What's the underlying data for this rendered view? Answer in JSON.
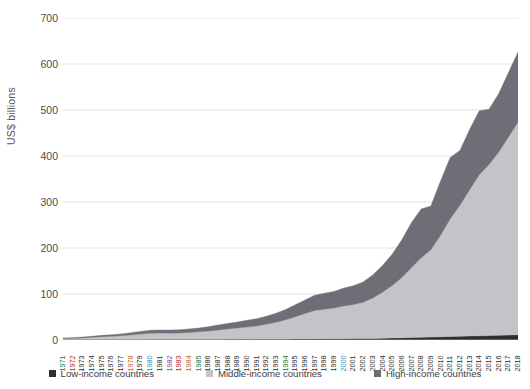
{
  "chart_data": {
    "type": "area",
    "stacked": true,
    "title": "",
    "xlabel": "",
    "ylabel": "US$ billions",
    "ylim": [
      0,
      700
    ],
    "y_ticks": [
      0,
      100,
      200,
      300,
      400,
      500,
      600,
      700
    ],
    "grid": true,
    "legend_position": "bottom",
    "x": [
      "1971",
      "1972",
      "1973",
      "1974",
      "1975",
      "1976",
      "1977",
      "1978",
      "1979",
      "1980",
      "1981",
      "1982",
      "1983",
      "1984",
      "1985",
      "1986",
      "1987",
      "1988",
      "1989",
      "1990",
      "1991",
      "1992",
      "1993",
      "1994",
      "1995",
      "1996",
      "1997",
      "1998",
      "1999",
      "2000",
      "2001",
      "2002",
      "2003",
      "2004",
      "2005",
      "2006",
      "2007",
      "2008",
      "2009",
      "2010",
      "2011",
      "2012",
      "2013",
      "2014",
      "2015",
      "2016",
      "2017",
      "2018"
    ],
    "series": [
      {
        "name": "Low-income countries",
        "color": "#2f2f33",
        "values": [
          0.2,
          0.2,
          0.3,
          0.4,
          0.5,
          0.5,
          0.6,
          0.7,
          0.8,
          0.9,
          0.9,
          0.9,
          1.0,
          1.0,
          1.1,
          1.2,
          1.3,
          1.4,
          1.5,
          1.6,
          1.6,
          1.7,
          1.8,
          1.9,
          2.1,
          2.2,
          2.4,
          2.5,
          2.6,
          2.8,
          3.0,
          3.2,
          3.5,
          3.9,
          4.3,
          4.8,
          5.4,
          6.0,
          6.3,
          6.9,
          7.5,
          8.0,
          8.6,
          9.2,
          9.6,
          10.1,
          10.8,
          11.5
        ]
      },
      {
        "name": "Middle-income countries",
        "color": "#c3c3c8",
        "values": [
          3.0,
          3.4,
          4.2,
          5.4,
          6.6,
          7.4,
          8.6,
          10.2,
          12.0,
          13.6,
          14.2,
          14.0,
          14.4,
          15.4,
          16.6,
          18.4,
          20.6,
          22.6,
          24.4,
          26.6,
          28.8,
          32.4,
          36.6,
          42.0,
          48.6,
          55.4,
          62.0,
          64.6,
          67.0,
          71.0,
          74.0,
          79.0,
          88.0,
          100.0,
          114.0,
          131.0,
          152.0,
          173.0,
          190.0,
          221.0,
          256.0,
          285.0,
          318.0,
          350.0,
          372.0,
          398.0,
          430.0,
          462.0
        ]
      },
      {
        "name": "High-income countries",
        "color": "#6e6e76",
        "values": [
          1.2,
          1.4,
          1.8,
          2.4,
          3.0,
          3.4,
          4.0,
          4.8,
          5.8,
          6.6,
          6.8,
          6.6,
          6.8,
          7.4,
          8.2,
          9.4,
          10.8,
          12.0,
          13.2,
          14.6,
          15.8,
          17.6,
          19.8,
          22.6,
          26.0,
          29.6,
          33.0,
          34.4,
          36.0,
          39.0,
          41.0,
          44.0,
          50.0,
          58.0,
          68.0,
          82.0,
          98.0,
          106.0,
          95.0,
          118.0,
          133.0,
          119.0,
          131.0,
          139.0,
          120.0,
          127.0,
          140.0,
          152.0
        ]
      }
    ]
  },
  "legend": {
    "items": [
      {
        "label": "Low-income countries",
        "color": "#2f2f33"
      },
      {
        "label": "Middle-income countries",
        "color": "#c3c3c8"
      },
      {
        "label": "High-income countries",
        "color": "#6e6e76"
      }
    ]
  },
  "axes": {
    "y_title": "US$ billions",
    "y_tick_labels": [
      "700",
      "600",
      "500",
      "400",
      "300",
      "200",
      "100",
      "0"
    ],
    "gridline_color": "#d9d9dd",
    "axis_color": "#8a8a90"
  }
}
